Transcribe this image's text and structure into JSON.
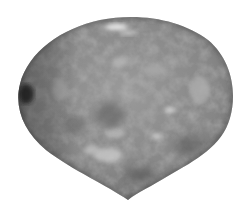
{
  "image": {
    "subject": "polished stone",
    "description": "Grayscale photo of a tumbled, teardrop-shaped polished stone with mottled texture on a white background",
    "background_color": "#ffffff",
    "stone_base_color": "#8a8a8a",
    "stone_dark_color": "#3a3a3a",
    "stone_light_color": "#c8c8c8",
    "highlight_color": "#e8e8e8"
  }
}
